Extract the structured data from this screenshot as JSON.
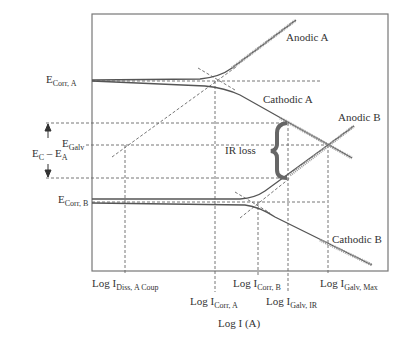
{
  "figure": {
    "x_axis_label": "Log I (A)",
    "y_axis_label": "Potential E (V)"
  },
  "curve_labels": {
    "anodic_a": "Anodic A",
    "cathodic_a": "Cathodic A",
    "anodic_b": "Anodic B",
    "cathodic_b": "Cathodic B",
    "ir_loss": "IR loss"
  },
  "y_labels": {
    "ecorr_a": {
      "main": "E",
      "sub": "Corr, A"
    },
    "ecorr_b": {
      "main": "E",
      "sub": "Corr, B"
    },
    "egalv": {
      "main": "E",
      "sub": "Galv"
    },
    "ec_minus_ea": {
      "c_main": "E",
      "c_sub": "C",
      "minus": " – ",
      "a_main": "E",
      "a_sub": "A"
    }
  },
  "x_labels": {
    "idiss": {
      "main": "Log I",
      "sub": "Diss, A Coup"
    },
    "icorr_a": {
      "main": "Log I",
      "sub": "Corr, A"
    },
    "icorr_b": {
      "main": "Log I",
      "sub": "Corr, B"
    },
    "igalv_ir": {
      "main": "Log I",
      "sub": "Galv, IR"
    },
    "igalv_max": {
      "main": "Log I",
      "sub": "Galv, Max"
    }
  },
  "colors": {
    "frame": "#777777",
    "curve": "#555555",
    "dashed": "#666666",
    "brace": "#666666"
  }
}
